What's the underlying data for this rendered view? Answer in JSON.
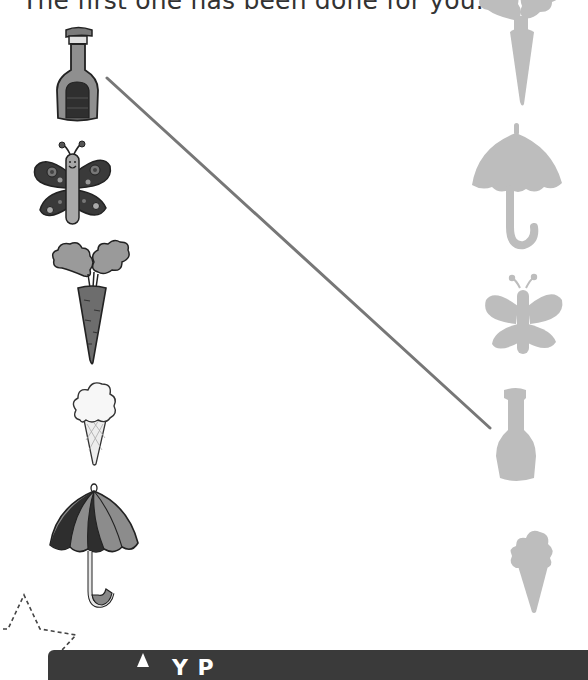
{
  "worksheet": {
    "instruction": "The first one has been done for you.",
    "left_column": [
      {
        "name": "bottle"
      },
      {
        "name": "butterfly"
      },
      {
        "name": "carrot"
      },
      {
        "name": "ice-cream"
      },
      {
        "name": "umbrella"
      }
    ],
    "right_column": [
      {
        "name": "carrot-silhouette"
      },
      {
        "name": "umbrella-silhouette"
      },
      {
        "name": "butterfly-silhouette"
      },
      {
        "name": "bottle-silhouette"
      },
      {
        "name": "ice-cream-silhouette"
      }
    ],
    "example_match": {
      "from": "bottle",
      "to": "bottle-silhouette"
    },
    "colors": {
      "dark_fill": "#3d3d3d",
      "mid_fill": "#8a8a8a",
      "light_fill": "#b5b5b5",
      "silhouette": "#bdbdbd",
      "line": "#777777",
      "banner": "#3a3a3a"
    }
  },
  "footer": {
    "banner_text": "Y        P",
    "icon": "triangle-icon"
  }
}
